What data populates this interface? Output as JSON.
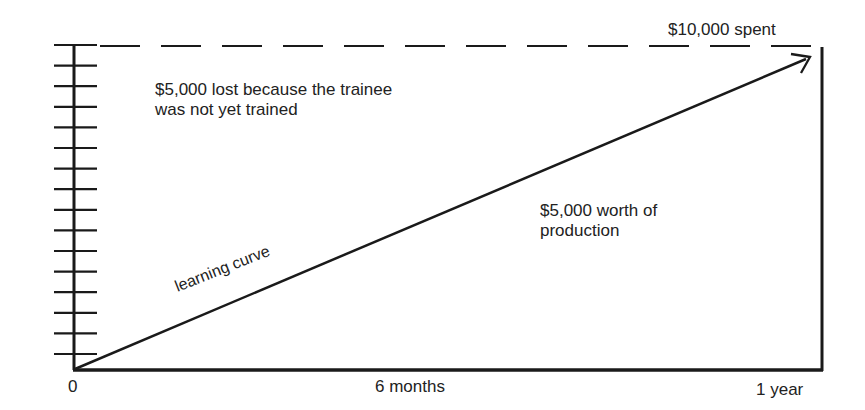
{
  "diagram": {
    "type": "cost-of-training-learning-curve",
    "top_label": "$10,000 spent",
    "upper_region_label": [
      "$5,000 lost because the trainee",
      "was not yet trained"
    ],
    "lower_region_label": [
      "$5,000 worth of",
      "production"
    ],
    "curve_label": "learning curve",
    "x_axis": {
      "ticks": [
        "0",
        "6 months",
        "1 year"
      ]
    },
    "y_axis": {
      "tick_count": 16,
      "tick_labels": []
    },
    "elements": {
      "dashed_line": "top boundary representing total spend",
      "diagonal_arrow": "learning curve from origin to top-right",
      "frame": "left axis with ticks, bottom axis, right vertical edge"
    }
  },
  "colors": {
    "ink": "#1a1a1a",
    "background": "#ffffff"
  }
}
